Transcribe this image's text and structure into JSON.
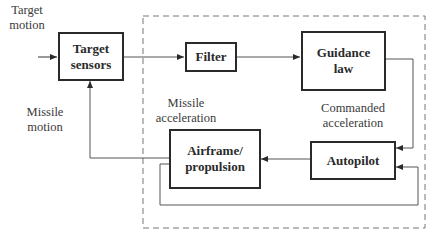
{
  "diagram": {
    "type": "block-diagram",
    "title": "",
    "blocks": [
      {
        "id": "target_sensors",
        "label": "Target\nsensors"
      },
      {
        "id": "filter",
        "label": "Filter"
      },
      {
        "id": "guidance_law",
        "label": "Guidance\nlaw"
      },
      {
        "id": "autopilot",
        "label": "Autopilot"
      },
      {
        "id": "airframe",
        "label": "Airframe/\npropulsion"
      }
    ],
    "labels": {
      "target_motion": "Target\nmotion",
      "missile_motion": "Missile\nmotion",
      "missile_acceleration": "Missile\nacceleration",
      "commanded_acceleration": "Commanded\nacceleration"
    },
    "edges": [
      {
        "from": "target_motion",
        "to": "target_sensors"
      },
      {
        "from": "target_sensors",
        "to": "filter"
      },
      {
        "from": "filter",
        "to": "guidance_law"
      },
      {
        "from": "guidance_law",
        "to": "autopilot",
        "label": "Commanded acceleration"
      },
      {
        "from": "autopilot",
        "to": "airframe"
      },
      {
        "from": "airframe",
        "to": "target_sensors",
        "label": "Missile motion"
      },
      {
        "from": "airframe",
        "to": "autopilot",
        "label": "Missile acceleration (feedback)"
      }
    ],
    "boundary": "dashed enclosure around Filter, Guidance law, Autopilot, Airframe/propulsion"
  }
}
